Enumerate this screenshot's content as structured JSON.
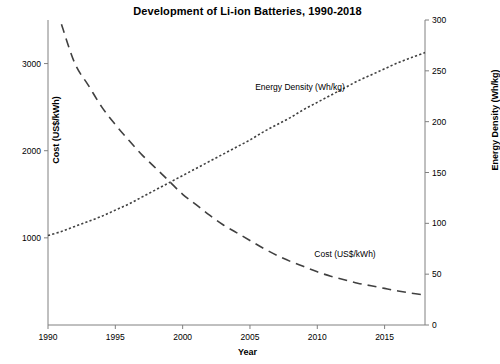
{
  "chart_data": {
    "type": "line",
    "title": "Development of Li-ion Batteries, 1990-2018",
    "xlabel": "Year",
    "ylabel": "Cost (US$/kWh)",
    "y2label": "Energy Density (Wh/kg)",
    "xlim": [
      1990,
      2018
    ],
    "xticks": [
      "1990",
      "1995",
      "2000",
      "2005",
      "2010",
      "2015"
    ],
    "ylim": [
      0,
      3500
    ],
    "yticks": [
      "1000",
      "2000",
      "3000"
    ],
    "y2lim": [
      0,
      300
    ],
    "y2ticks": [
      "0",
      "50",
      "100",
      "150",
      "200",
      "250",
      "300"
    ],
    "grid": false,
    "legend_position": "inline-annotations",
    "series": [
      {
        "name": "Cost (US$/kWh)",
        "axis": "left",
        "style": "dashed",
        "color": "#404040",
        "annotation": "Cost (US$/kWh)",
        "x": [
          1991,
          1992,
          1993,
          1994,
          1995,
          1996,
          1997,
          1998,
          1999,
          2000,
          2001,
          2002,
          2003,
          2004,
          2005,
          2006,
          2007,
          2008,
          2009,
          2010,
          2011,
          2012,
          2013,
          2014,
          2015,
          2016,
          2017,
          2018
        ],
        "values": [
          3450,
          3000,
          2750,
          2500,
          2300,
          2120,
          1950,
          1800,
          1650,
          1500,
          1380,
          1260,
          1150,
          1060,
          970,
          880,
          800,
          730,
          670,
          610,
          560,
          520,
          480,
          450,
          420,
          390,
          365,
          345
        ]
      },
      {
        "name": "Energy Density (Wh/kg)",
        "axis": "right",
        "style": "dotted",
        "color": "#404040",
        "annotation": "Energy Density (Wh/kg)",
        "x": [
          1990,
          1991,
          1992,
          1993,
          1994,
          1995,
          1996,
          1997,
          1998,
          1999,
          2000,
          2001,
          2002,
          2003,
          2004,
          2005,
          2006,
          2007,
          2008,
          2009,
          2010,
          2011,
          2012,
          2013,
          2014,
          2015,
          2016,
          2017,
          2018
        ],
        "values": [
          88,
          92,
          97,
          102,
          107,
          113,
          119,
          126,
          133,
          140,
          147,
          154,
          161,
          168,
          175,
          182,
          190,
          197,
          204,
          212,
          219,
          226,
          233,
          240,
          246,
          252,
          258,
          263,
          268
        ]
      }
    ]
  }
}
